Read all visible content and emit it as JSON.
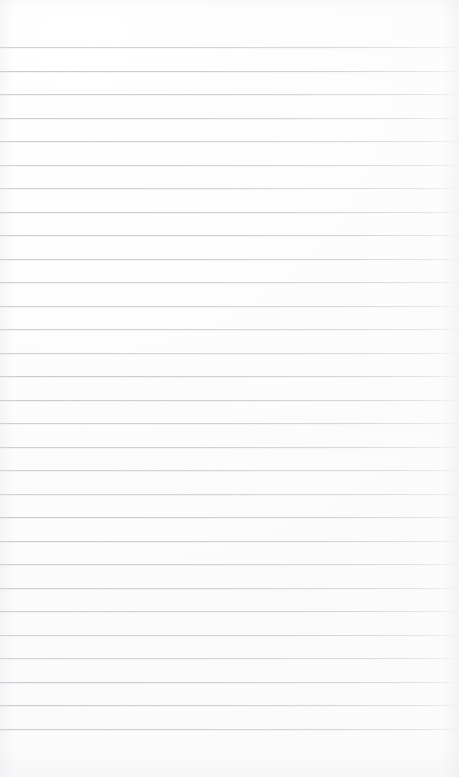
{
  "document": {
    "kind": "scanned-ruled-paper",
    "description": "Blank lined notebook page",
    "orientation": "portrait",
    "has_text_content": false,
    "has_handwriting": false,
    "has_margin_rule": false
  },
  "page": {
    "width_px": 459,
    "height_px": 777,
    "background_color": "#fefefe",
    "paper_tint_color": "#fdfdfd"
  },
  "ruling": {
    "style": "horizontal-wide-ruled",
    "line_color": "#c5c9ce",
    "line_thickness_px": 1,
    "line_count": 30,
    "first_line_y_px": 47,
    "last_line_y_px": 728,
    "line_spacing_px": 23.5,
    "line_start_x_px": 0,
    "line_end_x_px": 459,
    "top_margin_px": 47,
    "bottom_margin_px": 49,
    "right_edge_fade_px": 5,
    "line_y_positions": [
      47,
      70.5,
      94,
      117.5,
      141,
      164.5,
      188,
      211.5,
      235,
      258.5,
      282,
      305.5,
      329,
      352.5,
      376,
      399.5,
      423,
      446.5,
      470,
      493.5,
      517,
      540.5,
      564,
      587.5,
      611,
      634.5,
      658,
      681.5,
      705,
      728.5
    ]
  }
}
